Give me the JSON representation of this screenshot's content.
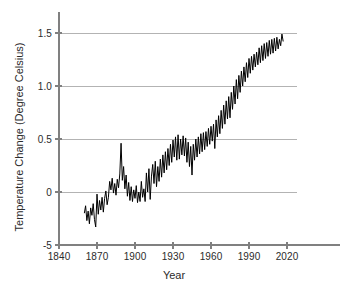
{
  "chart_data": {
    "type": "line",
    "title": "",
    "xlabel": "Year",
    "ylabel": "Temperature Change (Degree Celsius)",
    "xlim": [
      1840,
      2035
    ],
    "ylim": [
      -0.5,
      1.55
    ],
    "grid": true,
    "legend": null,
    "xticks": [
      1840,
      1870,
      1900,
      1930,
      1960,
      1990,
      2020
    ],
    "xtick_labels": [
      "1840",
      "1870",
      "1900",
      "1930",
      "1960",
      "1990",
      "2020"
    ],
    "yticks": [
      -0.5,
      0,
      0.5,
      1.0,
      1.5
    ],
    "ytick_labels": [
      "-5",
      "0",
      "0.5",
      "1.0",
      "1.5"
    ],
    "line_color": "#000000",
    "grid_color": "#b3b3b3",
    "axis_color": "#808080",
    "series": [
      {
        "name": "Global temperature change",
        "x": [
          1860,
          1861,
          1862,
          1863,
          1864,
          1865,
          1866,
          1867,
          1868,
          1869,
          1870,
          1871,
          1872,
          1873,
          1874,
          1875,
          1876,
          1877,
          1878,
          1879,
          1880,
          1881,
          1882,
          1883,
          1884,
          1885,
          1886,
          1887,
          1888,
          1889,
          1890,
          1891,
          1892,
          1893,
          1894,
          1895,
          1896,
          1897,
          1898,
          1899,
          1900,
          1901,
          1902,
          1903,
          1904,
          1905,
          1906,
          1907,
          1908,
          1909,
          1910,
          1911,
          1912,
          1913,
          1914,
          1915,
          1916,
          1917,
          1918,
          1919,
          1920,
          1921,
          1922,
          1923,
          1924,
          1925,
          1926,
          1927,
          1928,
          1929,
          1930,
          1931,
          1932,
          1933,
          1934,
          1935,
          1936,
          1937,
          1938,
          1939,
          1940,
          1941,
          1942,
          1943,
          1944,
          1945,
          1946,
          1947,
          1948,
          1949,
          1950,
          1951,
          1952,
          1953,
          1954,
          1955,
          1956,
          1957,
          1958,
          1959,
          1960,
          1961,
          1962,
          1963,
          1964,
          1965,
          1966,
          1967,
          1968,
          1969,
          1970,
          1971,
          1972,
          1973,
          1974,
          1975,
          1976,
          1977,
          1978,
          1979,
          1980,
          1981,
          1982,
          1983,
          1984,
          1985,
          1986,
          1987,
          1988,
          1989,
          1990,
          1991,
          1992,
          1993,
          1994,
          1995,
          1996,
          1997,
          1998,
          1999,
          2000,
          2001,
          2002,
          2003,
          2004,
          2005,
          2006,
          2007,
          2008,
          2009,
          2010,
          2011,
          2012,
          2013,
          2014,
          2015,
          2016,
          2017
        ],
        "y": [
          -0.2,
          -0.13,
          -0.27,
          -0.18,
          -0.3,
          -0.15,
          -0.22,
          -0.11,
          -0.26,
          -0.33,
          -0.02,
          -0.21,
          -0.08,
          -0.17,
          -0.05,
          -0.19,
          -0.06,
          0.01,
          -0.12,
          -0.05,
          0.1,
          0.02,
          0.13,
          -0.01,
          0.08,
          -0.03,
          0.12,
          0.04,
          0.17,
          0.46,
          0.11,
          0.24,
          0.03,
          0.16,
          -0.04,
          0.09,
          -0.08,
          0.05,
          -0.09,
          0.02,
          -0.06,
          0.06,
          -0.1,
          0.0,
          -0.09,
          0.1,
          -0.05,
          0.03,
          -0.09,
          0.18,
          0.0,
          0.22,
          -0.07,
          0.15,
          0.26,
          0.08,
          0.29,
          0.05,
          0.24,
          0.1,
          0.31,
          0.14,
          0.35,
          0.18,
          0.38,
          0.21,
          0.41,
          0.25,
          0.45,
          0.28,
          0.49,
          0.33,
          0.52,
          0.3,
          0.54,
          0.31,
          0.5,
          0.35,
          0.53,
          0.34,
          0.51,
          0.28,
          0.47,
          0.24,
          0.43,
          0.16,
          0.45,
          0.3,
          0.5,
          0.33,
          0.52,
          0.36,
          0.55,
          0.38,
          0.56,
          0.4,
          0.57,
          0.43,
          0.6,
          0.45,
          0.62,
          0.48,
          0.64,
          0.41,
          0.68,
          0.52,
          0.72,
          0.55,
          0.77,
          0.6,
          0.82,
          0.64,
          0.86,
          0.69,
          0.9,
          0.7,
          0.94,
          0.78,
          1.0,
          0.83,
          1.06,
          0.88,
          1.1,
          0.94,
          1.14,
          1.0,
          1.18,
          1.04,
          1.22,
          1.08,
          1.26,
          1.12,
          1.28,
          1.15,
          1.3,
          1.18,
          1.32,
          1.2,
          1.36,
          1.22,
          1.38,
          1.24,
          1.4,
          1.26,
          1.41,
          1.28,
          1.43,
          1.3,
          1.44,
          1.31,
          1.45,
          1.33,
          1.46,
          1.35,
          1.44,
          1.38,
          1.49,
          1.42
        ]
      }
    ]
  },
  "axis": {
    "x_title": "Year",
    "y_title": "Temperature Change (Degree Celsius)"
  }
}
